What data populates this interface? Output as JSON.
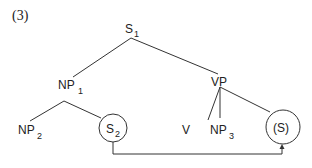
{
  "figure": {
    "number": "(3)"
  },
  "nodes": {
    "s1": {
      "base": "S",
      "sub": "1"
    },
    "np1": {
      "base": "NP",
      "sub": "1"
    },
    "vp": {
      "base": "VP",
      "sub": ""
    },
    "np2": {
      "base": "NP",
      "sub": "2"
    },
    "s2": {
      "base": "S",
      "sub": "2",
      "circled": true
    },
    "v": {
      "base": "V",
      "sub": ""
    },
    "np3": {
      "base": "NP",
      "sub": "3"
    },
    "s_target": {
      "base": "(S)",
      "sub": "",
      "circled": true
    }
  },
  "edges": [
    [
      "S1",
      "NP1"
    ],
    [
      "S1",
      "VP"
    ],
    [
      "NP1",
      "NP2"
    ],
    [
      "NP1",
      "S2"
    ],
    [
      "VP",
      "V"
    ],
    [
      "VP",
      "NP3"
    ],
    [
      "VP",
      "(S)"
    ]
  ],
  "arrow": {
    "from": "S2",
    "to": "(S)",
    "meaning": "movement"
  }
}
